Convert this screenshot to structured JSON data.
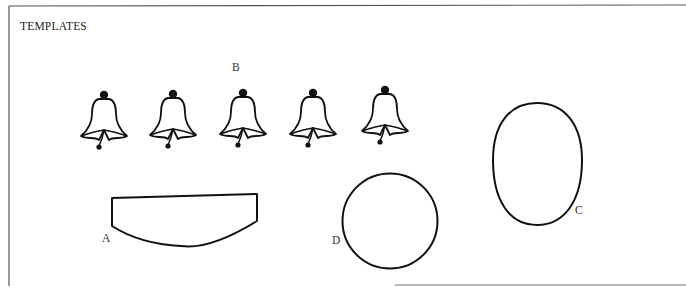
{
  "page": {
    "heading": "TEMPLATES"
  },
  "templates": [
    {
      "id": "A",
      "label": "A",
      "shape": "curved-bottom-strip"
    },
    {
      "id": "B",
      "label": "B",
      "shape": "bell",
      "count": 5
    },
    {
      "id": "C",
      "label": "C",
      "shape": "oval"
    },
    {
      "id": "D",
      "label": "D",
      "shape": "circle"
    }
  ],
  "labels": {
    "a": "A",
    "b": "B",
    "c": "C",
    "d": "D"
  },
  "colors": {
    "stroke": "#111111",
    "frame": "#555555",
    "background": "#ffffff"
  }
}
